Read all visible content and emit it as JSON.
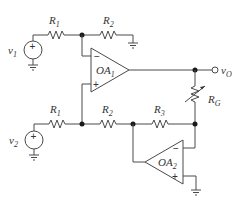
{
  "diagram": {
    "type": "circuit",
    "sources": [
      {
        "id": "v1",
        "label": "v",
        "subscript": "1",
        "polarity": "+"
      },
      {
        "id": "v2",
        "label": "v",
        "subscript": "2",
        "polarity": "+"
      }
    ],
    "resistors": [
      {
        "id": "R1_top",
        "label": "R",
        "subscript": "1"
      },
      {
        "id": "R2_top",
        "label": "R",
        "subscript": "2"
      },
      {
        "id": "R1_bottom",
        "label": "R",
        "subscript": "1"
      },
      {
        "id": "R2_bottom",
        "label": "R",
        "subscript": "2"
      },
      {
        "id": "R3",
        "label": "R",
        "subscript": "3"
      },
      {
        "id": "RG",
        "label": "R",
        "subscript": "G",
        "variable": true
      }
    ],
    "opamps": [
      {
        "id": "OA1",
        "label": "OA",
        "subscript": "1",
        "inv": "−",
        "noninv": "+"
      },
      {
        "id": "OA2",
        "label": "OA",
        "subscript": "2",
        "inv": "−",
        "noninv": "+"
      }
    ],
    "output": {
      "label": "v",
      "subscript": "O"
    },
    "colors": {
      "wire": "#4a4a4a",
      "node": "#1a1a1a",
      "text": "#333333",
      "background": "#ffffff"
    }
  }
}
